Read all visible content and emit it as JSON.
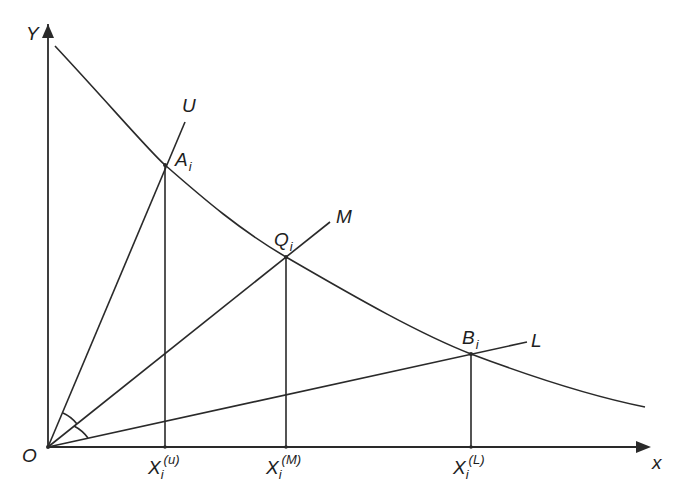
{
  "diagram": {
    "axes": {
      "y_label": "Y",
      "x_label": "x",
      "origin_label": "O"
    },
    "rays": [
      {
        "name": "U",
        "label": "U"
      },
      {
        "name": "M",
        "label": "M"
      },
      {
        "name": "L",
        "label": "L"
      }
    ],
    "points": [
      {
        "name": "A",
        "base": "A",
        "sub": "i"
      },
      {
        "name": "Q",
        "base": "Q",
        "sub": "i"
      },
      {
        "name": "B",
        "base": "B",
        "sub": "i"
      }
    ],
    "x_ticks": [
      {
        "base": "X",
        "sub": "i",
        "sup": "(u)"
      },
      {
        "base": "X",
        "sub": "i",
        "sup": "(M)"
      },
      {
        "base": "X",
        "sub": "i",
        "sup": "(L)"
      }
    ],
    "curve": "decreasing convex curve intersecting rays U, M, L at A_i, Q_i, B_i",
    "annotations": "two equal angle arcs at origin between rays U–M and M–L",
    "colors": {
      "line": "#2a2a2a",
      "background": "#ffffff"
    }
  }
}
